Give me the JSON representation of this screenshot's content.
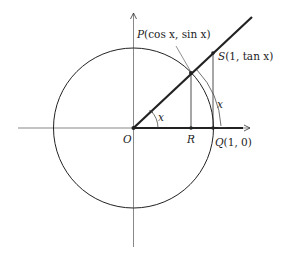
{
  "diagram": {
    "labels": {
      "P_name": "P",
      "P_coords": "(cos x, sin x)",
      "S_name": "S",
      "S_coords": "(1, tan x)",
      "O": "O",
      "R": "R",
      "Q_name": "Q",
      "Q_coords": "(1, 0)",
      "angle_inner": "x",
      "angle_outer": "x"
    },
    "points": {
      "O": [
        133.5,
        128
      ],
      "R": [
        191,
        128
      ],
      "Q": [
        213,
        128
      ],
      "P": [
        191,
        73
      ],
      "S": [
        213,
        53
      ]
    },
    "circle": {
      "cx": 133.5,
      "cy": 128,
      "r": 80
    },
    "colors": {
      "stroke": "#222222",
      "axis": "#555555",
      "background": "#ffffff"
    }
  }
}
